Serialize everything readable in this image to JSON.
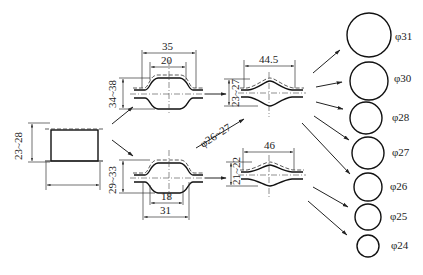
{
  "diagram": {
    "type": "forging-process-flow",
    "billet": {
      "height_label": "23~28"
    },
    "stage1_upper": {
      "outer_width": "35",
      "inner_width": "20",
      "height_label": "34~38"
    },
    "stage1_lower": {
      "outer_width": "31",
      "inner_width": "18",
      "height_label": "29~33"
    },
    "stage2_upper": {
      "width": "44.5",
      "height_label": "23~27"
    },
    "stage2_lower": {
      "width": "46",
      "height_label": "21~22"
    },
    "transfer_label": "φ26~27",
    "products": [
      {
        "label": "φ31"
      },
      {
        "label": "φ30"
      },
      {
        "label": "φ28"
      },
      {
        "label": "φ27"
      },
      {
        "label": "φ26"
      },
      {
        "label": "φ25"
      },
      {
        "label": "φ24"
      }
    ]
  }
}
